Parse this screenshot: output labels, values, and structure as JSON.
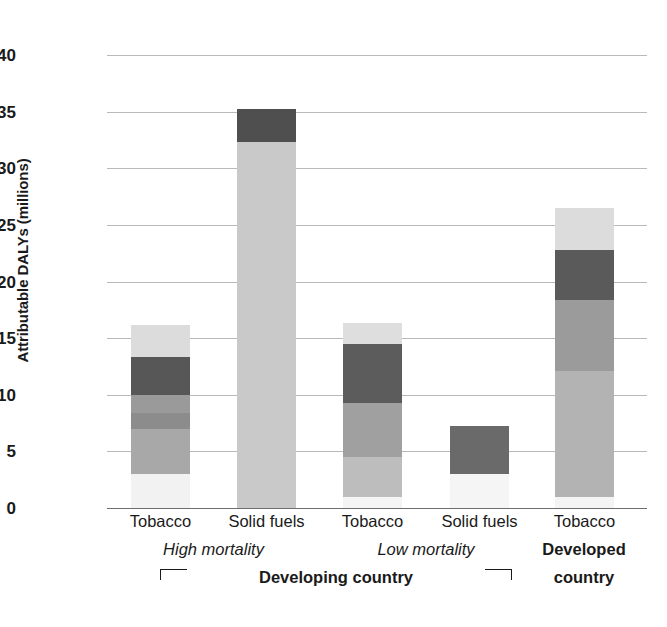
{
  "chart_data": {
    "type": "bar",
    "title": "",
    "subtitle": "",
    "xlabel": "",
    "ylabel": "Attributable DALYs (millions)",
    "ylim": [
      0,
      40
    ],
    "ytick_step": 5,
    "yticks": [
      40,
      35,
      30,
      25,
      20,
      15,
      10,
      5,
      0
    ],
    "grid": true,
    "legend": "none",
    "stacked": true,
    "categories": [
      "Tobacco",
      "Solid fuels",
      "Tobacco",
      "Solid fuels",
      "Tobacco"
    ],
    "group_labels": [
      "High mortality",
      "Low mortality",
      "Developed"
    ],
    "supergroup_label": "Developing country",
    "developed_label_line2": "country",
    "totals": [
      16.2,
      35.2,
      16.3,
      7.2,
      26.5
    ],
    "series": [
      {
        "name": "Tobacco - High mortality developing country",
        "total": 16.2,
        "segments": [
          {
            "from": 0.0,
            "to": 3.0,
            "color": "#f2f2f2"
          },
          {
            "from": 3.0,
            "to": 7.0,
            "color": "#a8a8a8"
          },
          {
            "from": 7.0,
            "to": 8.4,
            "color": "#8c8c8c"
          },
          {
            "from": 8.4,
            "to": 10.0,
            "color": "#9a9a9a"
          },
          {
            "from": 10.0,
            "to": 13.3,
            "color": "#575757"
          },
          {
            "from": 13.3,
            "to": 16.2,
            "color": "#dcdcdc"
          }
        ]
      },
      {
        "name": "Solid fuels - High mortality developing country",
        "total": 35.2,
        "segments": [
          {
            "from": 0.0,
            "to": 32.3,
            "color": "#c9c9c9"
          },
          {
            "from": 32.3,
            "to": 35.2,
            "color": "#4f4f4f"
          }
        ]
      },
      {
        "name": "Tobacco - Low mortality developing country",
        "total": 16.3,
        "segments": [
          {
            "from": 0.0,
            "to": 1.0,
            "color": "#f4f4f4"
          },
          {
            "from": 1.0,
            "to": 4.5,
            "color": "#bdbdbd"
          },
          {
            "from": 4.5,
            "to": 9.3,
            "color": "#a0a0a0"
          },
          {
            "from": 9.3,
            "to": 14.5,
            "color": "#5c5c5c"
          },
          {
            "from": 14.5,
            "to": 16.3,
            "color": "#dedede"
          }
        ]
      },
      {
        "name": "Solid fuels - Low mortality developing country",
        "total": 7.2,
        "segments": [
          {
            "from": 0.0,
            "to": 3.0,
            "color": "#f5f5f5"
          },
          {
            "from": 3.0,
            "to": 7.2,
            "color": "#6a6a6a"
          }
        ]
      },
      {
        "name": "Tobacco - Developed country",
        "total": 26.5,
        "segments": [
          {
            "from": 0.0,
            "to": 1.0,
            "color": "#f4f4f4"
          },
          {
            "from": 1.0,
            "to": 12.1,
            "color": "#b3b3b3"
          },
          {
            "from": 12.1,
            "to": 18.4,
            "color": "#9b9b9b"
          },
          {
            "from": 18.4,
            "to": 22.8,
            "color": "#5a5a5a"
          },
          {
            "from": 22.8,
            "to": 26.5,
            "color": "#dcdcdc"
          }
        ]
      }
    ]
  },
  "axis": {
    "y_title": "Attributable DALYs (millions)"
  },
  "colors": {
    "gridline": "#b9b9b9",
    "baseline": "#6e6e6e",
    "text": "#1a1a1a",
    "background": "#ffffff"
  }
}
